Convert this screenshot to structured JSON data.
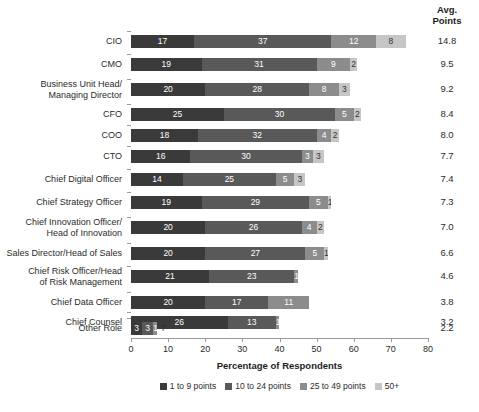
{
  "avg_header": {
    "line1": "Avg.",
    "line2": "Points"
  },
  "chart_data": {
    "type": "bar",
    "subtype": "stacked-horizontal",
    "title": "",
    "xlabel": "Percentage of Respondents",
    "ylabel": "",
    "xlim": [
      0,
      80
    ],
    "xticks": [
      0,
      10,
      20,
      30,
      40,
      50,
      60,
      70,
      80
    ],
    "xtick_labels": [
      "0",
      "10",
      "20",
      "30",
      "40",
      "50",
      "60",
      "70",
      "80"
    ],
    "grid": false,
    "legend_position": "bottom",
    "series": [
      {
        "name": "1 to 9 points",
        "color": "#3a3a3a",
        "values": [
          17,
          19,
          20,
          25,
          18,
          16,
          14,
          19,
          20,
          20,
          21,
          20,
          26,
          3
        ]
      },
      {
        "name": "10 to 24 points",
        "color": "#595959",
        "values": [
          37,
          31,
          28,
          30,
          32,
          30,
          25,
          29,
          26,
          27,
          23,
          17,
          13,
          3
        ]
      },
      {
        "name": "25 to 49 points",
        "color": "#8c8c8c",
        "values": [
          12,
          9,
          8,
          5,
          4,
          3,
          5,
          5,
          4,
          5,
          1,
          11,
          1,
          1
        ]
      },
      {
        "name": "50+",
        "color": "#c6c6c6",
        "values": [
          8,
          2,
          3,
          2,
          2,
          3,
          3,
          1,
          2,
          1,
          0,
          0,
          0,
          0
        ]
      }
    ],
    "categories": [
      "CIO",
      "CMO",
      "Business Unit Head/ Managing Director",
      "CFO",
      "COO",
      "CTO",
      "Chief Digital Officer",
      "Chief Strategy Officer",
      "Chief Innovation Officer/ Head of Innovation",
      "Sales Director/Head of Sales",
      "Chief Risk Officer/Head of Risk Management",
      "Chief Data Officer",
      "Chief Counsel",
      "Other Role"
    ],
    "avg_points": [
      14.8,
      9.5,
      9.2,
      8.4,
      8.0,
      7.7,
      7.4,
      7.3,
      7.0,
      6.6,
      4.6,
      3.8,
      3.2,
      2.2
    ]
  },
  "rows": [
    {
      "label_lines": [
        "CIO"
      ],
      "segments": [
        17,
        37,
        12,
        8
      ],
      "avg": "14.8",
      "outside": ""
    },
    {
      "label_lines": [
        "CMO"
      ],
      "segments": [
        19,
        31,
        9,
        2
      ],
      "avg": "9.5",
      "outside": ""
    },
    {
      "label_lines": [
        "Business Unit Head/",
        "Managing Director"
      ],
      "segments": [
        20,
        28,
        8,
        3
      ],
      "avg": "9.2",
      "outside": ""
    },
    {
      "label_lines": [
        "CFO"
      ],
      "segments": [
        25,
        30,
        5,
        2
      ],
      "avg": "8.4",
      "outside": ""
    },
    {
      "label_lines": [
        "COO"
      ],
      "segments": [
        18,
        32,
        4,
        2
      ],
      "avg": "8.0",
      "outside": ""
    },
    {
      "label_lines": [
        "CTO"
      ],
      "segments": [
        16,
        30,
        3,
        3
      ],
      "avg": "7.7",
      "outside": ""
    },
    {
      "label_lines": [
        "Chief Digital Officer"
      ],
      "segments": [
        14,
        25,
        5,
        3
      ],
      "avg": "7.4",
      "outside": ""
    },
    {
      "label_lines": [
        "Chief Strategy Officer"
      ],
      "segments": [
        19,
        29,
        5,
        1
      ],
      "avg": "7.3",
      "outside": ""
    },
    {
      "label_lines": [
        "Chief Innovation Officer/",
        "Head of Innovation"
      ],
      "segments": [
        20,
        26,
        4,
        2
      ],
      "avg": "7.0",
      "outside": ""
    },
    {
      "label_lines": [
        "Sales Director/Head of Sales"
      ],
      "segments": [
        20,
        27,
        5,
        1
      ],
      "avg": "6.6",
      "outside": ""
    },
    {
      "label_lines": [
        "Chief Risk Officer/Head",
        "of Risk Management"
      ],
      "segments": [
        21,
        23,
        1,
        0
      ],
      "avg": "4.6",
      "outside": ""
    },
    {
      "label_lines": [
        "Chief Data Officer"
      ],
      "segments": [
        20,
        17,
        11,
        0
      ],
      "avg": "3.8",
      "outside": ""
    },
    {
      "label_lines": [
        "Chief Counsel"
      ],
      "segments": [
        26,
        13,
        1,
        0
      ],
      "avg": "3.2",
      "outside": ""
    },
    {
      "label_lines": [
        "Other Role"
      ],
      "segments": [
        3,
        3,
        1,
        0
      ],
      "avg": "2.2",
      "outside": "7"
    }
  ],
  "axis": {
    "title": "Percentage of Respondents",
    "ticks": [
      "0",
      "10",
      "20",
      "30",
      "40",
      "50",
      "60",
      "70",
      "80"
    ]
  },
  "legend": [
    {
      "label": "1 to 9 points",
      "color": "#3a3a3a"
    },
    {
      "label": "10 to 24 points",
      "color": "#595959"
    },
    {
      "label": "25 to 49 points",
      "color": "#8c8c8c"
    },
    {
      "label": "50+",
      "color": "#c6c6c6"
    }
  ]
}
